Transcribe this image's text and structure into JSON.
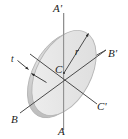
{
  "figure": {
    "colors": {
      "disk_face": "#e4e4e4",
      "disk_face_light": "#efefef",
      "disk_edge": "#b9b9b9",
      "disk_rim": "#c9c9c9",
      "axis_line": "#4a4a4a",
      "vertical_axis_line": "#8e8e8e",
      "label_text": "#1b1b1b",
      "background": "#ffffff"
    },
    "labels": {
      "axis_a_top": "A'",
      "axis_a_bottom": "A",
      "axis_b_right": "B'",
      "axis_b_left": "B",
      "axis_c_right": "C'",
      "center": "C",
      "radius": "r",
      "thickness": "t"
    },
    "geometry": {
      "center_x": 64,
      "center_y": 73,
      "disk_radius_major": 46,
      "disk_radius_minor": 27,
      "disk_tilt_degrees": -62,
      "thickness_px": 6
    }
  }
}
